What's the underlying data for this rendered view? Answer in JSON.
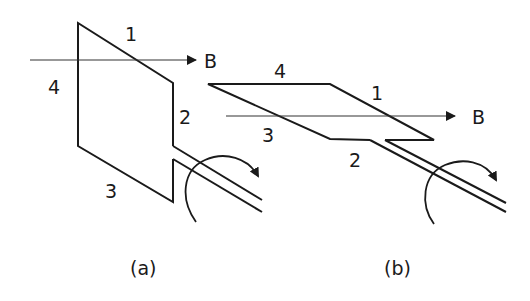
{
  "figure_a": {
    "caption": "(a)",
    "field_label": "B",
    "side_labels": {
      "s1": "1",
      "s2": "2",
      "s3": "3",
      "s4": "4"
    }
  },
  "figure_b": {
    "caption": "(b)",
    "field_label": "B",
    "side_labels": {
      "s1": "1",
      "s2": "2",
      "s3": "3",
      "s4": "4"
    }
  },
  "colors": {
    "line": "#1a1a1a",
    "background": "#ffffff"
  }
}
